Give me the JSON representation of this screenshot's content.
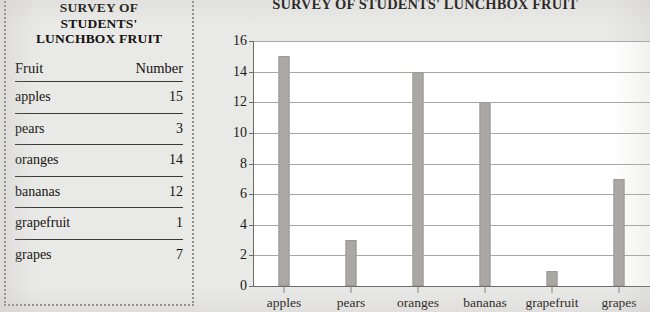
{
  "table": {
    "title_lines": [
      "SURVEY OF",
      "STUDENTS'",
      "LUNCHBOX FRUIT"
    ],
    "columns": [
      "Fruit",
      "Number"
    ],
    "rows": [
      {
        "fruit": "apples",
        "number": "15"
      },
      {
        "fruit": "pears",
        "number": "3"
      },
      {
        "fruit": "oranges",
        "number": "14"
      },
      {
        "fruit": "bananas",
        "number": "12"
      },
      {
        "fruit": "grapefruit",
        "number": "1"
      },
      {
        "fruit": "grapes",
        "number": "7"
      }
    ]
  },
  "chart": {
    "title": "SURVEY OF STUDENTS' LUNCHBOX FRUIT"
  },
  "chart_data": {
    "type": "bar",
    "title": "SURVEY OF STUDENTS' LUNCHBOX FRUIT",
    "xlabel": "",
    "ylabel": "",
    "categories": [
      "apples",
      "pears",
      "oranges",
      "bananas",
      "grapefruit",
      "grapes"
    ],
    "values": [
      15,
      3,
      14,
      12,
      1,
      7
    ],
    "ylim": [
      0,
      16
    ],
    "yticks": [
      0,
      2,
      4,
      6,
      8,
      10,
      12,
      14,
      16
    ],
    "grid": true,
    "legend": false,
    "bar_color": "#a9a8a5",
    "plot_background": "#ffffff",
    "page_background": "#e9e9e7"
  }
}
